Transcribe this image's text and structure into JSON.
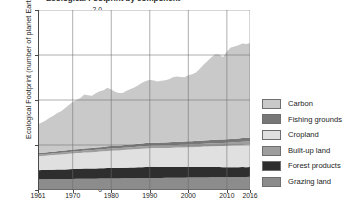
{
  "chart_data": {
    "type": "area",
    "stacked": true,
    "title": "Ecological Footprint by component",
    "xlabel": "",
    "ylabel": "Ecological Footprint (number of planet Earths)",
    "xlim": [
      1961,
      2016
    ],
    "ylim": [
      0,
      2.0
    ],
    "y_ticks": [
      "0",
      "0.5",
      "1.0",
      "1.5",
      "2.0"
    ],
    "y_tick_values": [
      0,
      0.5,
      1.0,
      1.5,
      2.0
    ],
    "x_ticks": [
      "1961",
      "1970",
      "1980",
      "1990",
      "2000",
      "2010",
      "2016"
    ],
    "x_tick_values": [
      1961,
      1970,
      1980,
      1990,
      2000,
      2010,
      2016
    ],
    "grid": true,
    "legend_position": "right",
    "legend_order": [
      "Carbon",
      "Fishing grounds",
      "Cropland",
      "Built-up land",
      "Forest products",
      "Grazing land"
    ],
    "stack_order_bottom_to_top": [
      "Grazing land",
      "Forest products",
      "Cropland",
      "Built-up land",
      "Fishing grounds",
      "Carbon"
    ],
    "x": [
      1961,
      1962,
      1963,
      1964,
      1965,
      1966,
      1967,
      1968,
      1969,
      1970,
      1971,
      1972,
      1973,
      1974,
      1975,
      1976,
      1977,
      1978,
      1979,
      1980,
      1981,
      1982,
      1983,
      1984,
      1985,
      1986,
      1987,
      1988,
      1989,
      1990,
      1991,
      1992,
      1993,
      1994,
      1995,
      1996,
      1997,
      1998,
      1999,
      2000,
      2001,
      2002,
      2003,
      2004,
      2005,
      2006,
      2007,
      2008,
      2009,
      2010,
      2011,
      2012,
      2013,
      2014,
      2015,
      2016
    ],
    "series": [
      {
        "name": "Grazing land",
        "color": "#8c8c8c",
        "values": [
          0.12,
          0.12,
          0.12,
          0.121,
          0.121,
          0.122,
          0.122,
          0.122,
          0.123,
          0.123,
          0.124,
          0.124,
          0.125,
          0.125,
          0.126,
          0.126,
          0.127,
          0.127,
          0.128,
          0.128,
          0.129,
          0.129,
          0.13,
          0.13,
          0.131,
          0.131,
          0.132,
          0.132,
          0.133,
          0.133,
          0.134,
          0.134,
          0.134,
          0.135,
          0.135,
          0.136,
          0.136,
          0.137,
          0.137,
          0.138,
          0.138,
          0.139,
          0.139,
          0.14,
          0.14,
          0.141,
          0.141,
          0.142,
          0.142,
          0.143,
          0.143,
          0.144,
          0.144,
          0.145,
          0.145,
          0.146
        ]
      },
      {
        "name": "Forest products",
        "color": "#2e2e2e",
        "values": [
          0.1,
          0.101,
          0.102,
          0.103,
          0.104,
          0.105,
          0.106,
          0.107,
          0.108,
          0.11,
          0.111,
          0.112,
          0.113,
          0.113,
          0.112,
          0.113,
          0.114,
          0.115,
          0.116,
          0.117,
          0.116,
          0.116,
          0.117,
          0.118,
          0.119,
          0.12,
          0.121,
          0.122,
          0.123,
          0.124,
          0.123,
          0.122,
          0.121,
          0.12,
          0.12,
          0.119,
          0.119,
          0.118,
          0.118,
          0.118,
          0.117,
          0.117,
          0.116,
          0.116,
          0.115,
          0.115,
          0.114,
          0.113,
          0.11,
          0.111,
          0.111,
          0.11,
          0.11,
          0.11,
          0.109,
          0.109
        ]
      },
      {
        "name": "Cropland",
        "color": "#e0e0e0",
        "values": [
          0.155,
          0.157,
          0.159,
          0.161,
          0.163,
          0.165,
          0.167,
          0.169,
          0.171,
          0.173,
          0.175,
          0.176,
          0.178,
          0.18,
          0.182,
          0.184,
          0.186,
          0.188,
          0.19,
          0.192,
          0.193,
          0.195,
          0.197,
          0.199,
          0.2,
          0.202,
          0.203,
          0.205,
          0.206,
          0.208,
          0.209,
          0.21,
          0.211,
          0.212,
          0.213,
          0.215,
          0.216,
          0.217,
          0.218,
          0.219,
          0.221,
          0.222,
          0.224,
          0.226,
          0.228,
          0.23,
          0.232,
          0.234,
          0.236,
          0.238,
          0.24,
          0.242,
          0.244,
          0.246,
          0.248,
          0.25
        ]
      },
      {
        "name": "Built-up land",
        "color": "#9e9e9e",
        "values": [
          0.018,
          0.018,
          0.018,
          0.019,
          0.019,
          0.019,
          0.02,
          0.02,
          0.02,
          0.021,
          0.021,
          0.021,
          0.022,
          0.022,
          0.022,
          0.023,
          0.023,
          0.023,
          0.024,
          0.024,
          0.025,
          0.025,
          0.025,
          0.026,
          0.026,
          0.026,
          0.027,
          0.027,
          0.027,
          0.028,
          0.028,
          0.028,
          0.029,
          0.029,
          0.029,
          0.03,
          0.03,
          0.03,
          0.031,
          0.031,
          0.031,
          0.032,
          0.032,
          0.032,
          0.033,
          0.033,
          0.033,
          0.034,
          0.034,
          0.034,
          0.035,
          0.035,
          0.035,
          0.036,
          0.036,
          0.036
        ]
      },
      {
        "name": "Fishing grounds",
        "color": "#777777",
        "values": [
          0.017,
          0.018,
          0.018,
          0.019,
          0.019,
          0.02,
          0.021,
          0.021,
          0.022,
          0.022,
          0.023,
          0.023,
          0.024,
          0.024,
          0.025,
          0.025,
          0.026,
          0.026,
          0.027,
          0.027,
          0.028,
          0.028,
          0.029,
          0.029,
          0.03,
          0.03,
          0.031,
          0.031,
          0.032,
          0.032,
          0.032,
          0.032,
          0.033,
          0.033,
          0.033,
          0.034,
          0.034,
          0.034,
          0.035,
          0.035,
          0.035,
          0.036,
          0.036,
          0.036,
          0.037,
          0.037,
          0.037,
          0.038,
          0.038,
          0.038,
          0.039,
          0.039,
          0.039,
          0.04,
          0.04,
          0.04
        ]
      },
      {
        "name": "Carbon",
        "color": "#c9c9c9",
        "values": [
          0.32,
          0.335,
          0.355,
          0.38,
          0.4,
          0.425,
          0.44,
          0.47,
          0.5,
          0.53,
          0.545,
          0.565,
          0.6,
          0.59,
          0.58,
          0.605,
          0.62,
          0.63,
          0.65,
          0.63,
          0.6,
          0.585,
          0.58,
          0.6,
          0.615,
          0.63,
          0.65,
          0.675,
          0.69,
          0.7,
          0.69,
          0.68,
          0.685,
          0.69,
          0.7,
          0.72,
          0.725,
          0.72,
          0.715,
          0.735,
          0.745,
          0.76,
          0.8,
          0.845,
          0.88,
          0.92,
          0.95,
          0.945,
          0.915,
          0.975,
          1.015,
          1.025,
          1.035,
          1.05,
          1.045,
          1.05
        ]
      }
    ],
    "totals": [
      0.73,
      0.749,
      0.772,
      0.803,
      0.826,
      0.856,
      0.876,
      0.909,
      0.944,
      0.979,
      0.999,
      1.021,
      1.062,
      1.054,
      1.047,
      1.076,
      1.096,
      1.111,
      1.135,
      1.118,
      1.091,
      1.078,
      1.078,
      1.099,
      1.121,
      1.139,
      1.164,
      1.192,
      1.211,
      1.225,
      1.216,
      1.206,
      1.213,
      1.219,
      1.23,
      1.254,
      1.26,
      1.256,
      1.254,
      1.276,
      1.287,
      1.306,
      1.347,
      1.396,
      1.433,
      1.476,
      1.507,
      1.506,
      1.475,
      1.539,
      1.583,
      1.595,
      1.607,
      1.627,
      1.623,
      1.631
    ]
  },
  "legend": {
    "items": [
      {
        "label": "Carbon",
        "color": "#c9c9c9"
      },
      {
        "label": "Fishing grounds",
        "color": "#777777"
      },
      {
        "label": "Cropland",
        "color": "#e0e0e0"
      },
      {
        "label": "Built-up land",
        "color": "#9e9e9e"
      },
      {
        "label": "Forest products",
        "color": "#2e2e2e"
      },
      {
        "label": "Grazing land",
        "color": "#8c8c8c"
      }
    ]
  }
}
